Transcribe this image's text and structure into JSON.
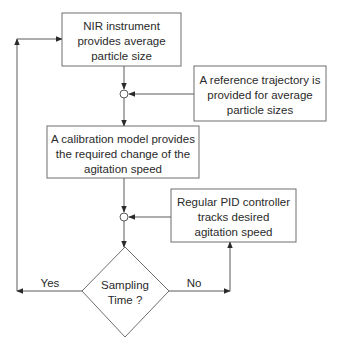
{
  "diagram": {
    "type": "flowchart",
    "nodes": {
      "nir": {
        "shape": "rectangle",
        "lines": [
          "NIR instrument",
          "provides average",
          "particle size"
        ]
      },
      "reference": {
        "shape": "rectangle",
        "lines": [
          "A reference trajectory is",
          "provided for average",
          "particle sizes"
        ]
      },
      "calibration": {
        "shape": "rectangle",
        "lines": [
          "A calibration model provides",
          "the required change of the",
          "agitation speed"
        ]
      },
      "pid": {
        "shape": "rectangle",
        "lines": [
          "Regular PID controller",
          "tracks desired",
          "agitation speed"
        ]
      },
      "sampling": {
        "shape": "diamond",
        "lines": [
          "Sampling",
          "Time ?"
        ]
      },
      "junction1": {
        "shape": "summing-junction"
      },
      "junction2": {
        "shape": "summing-junction"
      }
    },
    "edges": [
      {
        "from": "nir",
        "to": "junction1"
      },
      {
        "from": "reference",
        "to": "junction1"
      },
      {
        "from": "junction1",
        "to": "calibration"
      },
      {
        "from": "calibration",
        "to": "junction2"
      },
      {
        "from": "pid",
        "to": "junction2"
      },
      {
        "from": "junction2",
        "to": "sampling"
      },
      {
        "from": "sampling",
        "to": "nir",
        "label": "Yes"
      },
      {
        "from": "sampling",
        "to": "pid",
        "label": "No"
      }
    ],
    "labels": {
      "yes": "Yes",
      "no": "No"
    }
  }
}
